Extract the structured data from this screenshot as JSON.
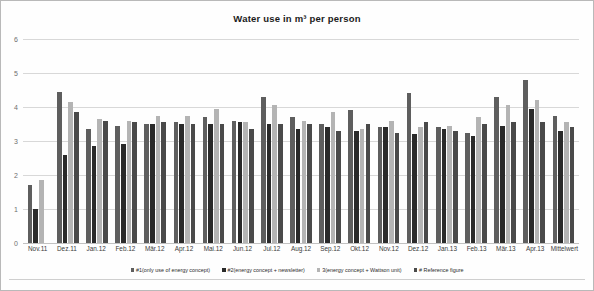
{
  "chart_data": {
    "type": "bar",
    "title": "Water use in m³ per person",
    "xlabel": "",
    "ylabel": "",
    "ylim": [
      0,
      6
    ],
    "yticks": [
      0,
      1,
      2,
      3,
      4,
      5,
      6
    ],
    "grid": true,
    "legend_position": "bottom",
    "categories": [
      "Nov.11",
      "Dez.11",
      "Jan.12",
      "Feb.12",
      "Mär.12",
      "Apr.12",
      "Mai.12",
      "Jun.12",
      "Jul.12",
      "Aug.12",
      "Sep.12",
      "Okt.12",
      "Nov.12",
      "Dez.12",
      "Jan.13",
      "Feb.13",
      "Mär.13",
      "Apr.13",
      "Mittelwert"
    ],
    "series": [
      {
        "name": "#1(only use of energy concept)",
        "color": "#5e5e5e",
        "values": [
          1.7,
          4.45,
          3.35,
          3.45,
          3.5,
          3.55,
          3.7,
          3.6,
          4.3,
          3.7,
          3.5,
          3.9,
          3.4,
          4.4,
          3.4,
          3.25,
          4.3,
          4.8,
          3.75
        ]
      },
      {
        "name": "#2(energy concept + newsletter)",
        "color": "#2a2a2a",
        "values": [
          1.0,
          2.6,
          2.85,
          2.9,
          3.5,
          3.5,
          3.5,
          3.55,
          3.5,
          3.35,
          3.4,
          3.3,
          3.4,
          3.2,
          3.35,
          3.15,
          3.45,
          3.95,
          3.3
        ]
      },
      {
        "name": "#3(energy concept + Wattson unit)",
        "color": "#b4b4b4",
        "values": [
          1.85,
          4.15,
          3.65,
          3.6,
          3.75,
          3.75,
          3.95,
          3.55,
          4.05,
          3.6,
          3.85,
          3.35,
          3.6,
          3.4,
          3.45,
          3.7,
          4.05,
          4.2,
          3.55
        ]
      },
      {
        "name": "#4 Reference figure",
        "color": "#4a4a4a",
        "values": [
          0.0,
          3.85,
          3.6,
          3.55,
          3.55,
          3.5,
          3.5,
          3.35,
          3.5,
          3.5,
          3.3,
          3.5,
          3.25,
          3.55,
          3.3,
          3.5,
          3.55,
          3.55,
          3.4
        ]
      }
    ]
  },
  "legend": {
    "items": [
      {
        "label": "#1(only use of energy concept)",
        "color": "#5e5e5e"
      },
      {
        "label": "#2(energy concept + newsletter)",
        "color": "#2a2a2a"
      },
      {
        "label": "3(energy concept + Wattson unit)",
        "color": "#b4b4b4"
      },
      {
        "label": "# Reference figure",
        "color": "#4a4a4a"
      }
    ]
  }
}
